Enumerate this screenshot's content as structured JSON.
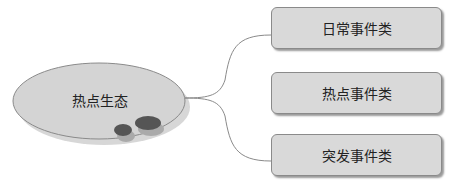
{
  "center": {
    "label": "热点生态"
  },
  "branches": [
    {
      "label": "日常事件类"
    },
    {
      "label": "热点事件类"
    },
    {
      "label": "突发事件类"
    }
  ],
  "colors": {
    "box_fill": "#d9d9d9",
    "ellipse_fill": "#d4d4d4",
    "dot_fill": "#555555",
    "line": "#8a8a8a"
  }
}
